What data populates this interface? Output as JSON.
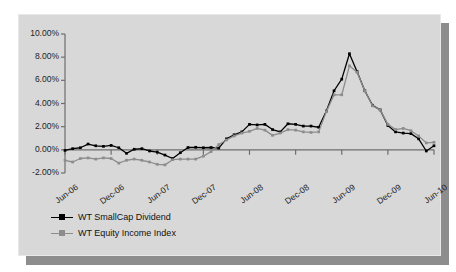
{
  "chart_data": {
    "type": "line",
    "title": "",
    "subtitle": "",
    "xlabel": "",
    "ylabel": "",
    "grid": false,
    "legend_position": "bottom-left",
    "ylim": [
      -2,
      10
    ],
    "ytick_labels": [
      "10.00%",
      "8.00%",
      "6.00%",
      "4.00%",
      "2.00%",
      "0.00%",
      "-2.00%"
    ],
    "ytick_values": [
      10,
      8,
      6,
      4,
      2,
      0,
      -2
    ],
    "xtick_labels": [
      "Jun-06",
      "Dec-06",
      "Jun-07",
      "Dec-07",
      "Jun-08",
      "Dec-08",
      "Jun-09",
      "Dec-09",
      "Jun-10"
    ],
    "xtick_indices": [
      0,
      6,
      12,
      18,
      24,
      30,
      36,
      42,
      48
    ],
    "x": [
      "Jun-06",
      "Jul-06",
      "Aug-06",
      "Sep-06",
      "Oct-06",
      "Nov-06",
      "Dec-06",
      "Jan-07",
      "Feb-07",
      "Mar-07",
      "Apr-07",
      "May-07",
      "Jun-07",
      "Jul-07",
      "Aug-07",
      "Sep-07",
      "Oct-07",
      "Nov-07",
      "Dec-07",
      "Jan-08",
      "Feb-08",
      "Mar-08",
      "Apr-08",
      "May-08",
      "Jun-08",
      "Jul-08",
      "Aug-08",
      "Sep-08",
      "Oct-08",
      "Nov-08",
      "Dec-08",
      "Jan-09",
      "Feb-09",
      "Mar-09",
      "Apr-09",
      "May-09",
      "Jun-09",
      "Jul-09",
      "Aug-09",
      "Sep-09",
      "Oct-09",
      "Nov-09",
      "Dec-09",
      "Jan-10",
      "Feb-10",
      "Mar-10",
      "Apr-10",
      "May-10",
      "Jun-10"
    ],
    "series": [
      {
        "name": "WT SmallCap Dividend",
        "color": "#000000",
        "marker": "square",
        "values": [
          -0.05,
          0.1,
          0.18,
          0.5,
          0.35,
          0.3,
          0.38,
          0.18,
          -0.3,
          0.05,
          0.1,
          -0.1,
          -0.2,
          -0.45,
          -0.75,
          -0.25,
          0.2,
          0.22,
          0.18,
          0.2,
          0.15,
          0.95,
          1.3,
          1.55,
          2.2,
          2.15,
          2.2,
          1.75,
          1.55,
          2.25,
          2.2,
          2.05,
          2.05,
          1.95,
          3.35,
          5.1,
          6.1,
          8.3,
          6.75,
          5.1,
          3.85,
          3.45,
          2.1,
          1.55,
          1.45,
          1.4,
          0.95,
          -0.1,
          0.35
        ]
      },
      {
        "name": "WT Equity Income Index",
        "color": "#8c8c8c",
        "marker": "square",
        "values": [
          -0.9,
          -1.05,
          -0.75,
          -0.7,
          -0.8,
          -0.7,
          -0.75,
          -1.15,
          -0.9,
          -0.8,
          -0.9,
          -1.05,
          -1.25,
          -1.3,
          -0.85,
          -0.8,
          -0.8,
          -0.8,
          -0.55,
          -0.15,
          0.45,
          0.85,
          1.2,
          1.45,
          1.6,
          1.85,
          1.7,
          1.25,
          1.45,
          1.75,
          1.7,
          1.55,
          1.5,
          1.55,
          3.3,
          4.75,
          4.75,
          7.25,
          6.7,
          5.1,
          3.8,
          3.45,
          2.2,
          1.75,
          1.85,
          1.65,
          1.2,
          0.6,
          0.65
        ]
      }
    ],
    "series2_tail": {
      "note": "tail values after Jun-09 continue through Jun-10"
    }
  },
  "legend": {
    "items": [
      {
        "label": "WT SmallCap Dividend",
        "color": "#000000"
      },
      {
        "label": "WT Equity Income Index",
        "color": "#8c8c8c"
      }
    ]
  },
  "colors": {
    "panel_background": "#d8d8d8",
    "page_background": "#ffffff",
    "shadow": "#8d8d8d",
    "axis": "#6e6e6e",
    "text": "#1d1d1d",
    "series_1": "#000000",
    "series_2": "#8c8c8c"
  }
}
